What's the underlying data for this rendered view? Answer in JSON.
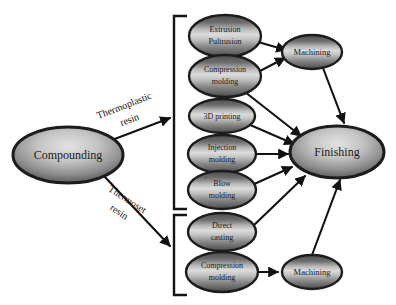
{
  "diagram": {
    "type": "flowchart",
    "background_color": "#ffffff",
    "node_border_color": "#1c1c1c",
    "node_fill_dark": "#585858",
    "node_fill_light": "#d8d8d8",
    "edge_color": "#111111",
    "nodes": [
      {
        "id": "compounding",
        "label_lines": [
          "Compounding"
        ],
        "cx": 68,
        "cy": 155,
        "rx": 55,
        "ry": 28,
        "font_size": 12
      },
      {
        "id": "extrusion-pultrusion",
        "label_lines": [
          "Extrusion",
          "Pultrusion"
        ],
        "cx": 225,
        "cy": 36,
        "rx": 36,
        "ry": 21,
        "font_size": 8
      },
      {
        "id": "compression-molding-thermoplastic",
        "label_lines": [
          "Compression",
          "molding"
        ],
        "cx": 225,
        "cy": 76,
        "rx": 36,
        "ry": 21,
        "font_size": 8
      },
      {
        "id": "3d-printing",
        "label_lines": [
          "3D printing"
        ],
        "cx": 222,
        "cy": 116,
        "rx": 33,
        "ry": 17,
        "font_size": 8
      },
      {
        "id": "injection-molding",
        "label_lines": [
          "Injection",
          "molding"
        ],
        "cx": 222,
        "cy": 154,
        "rx": 34,
        "ry": 19,
        "font_size": 8
      },
      {
        "id": "blow-molding",
        "label_lines": [
          "Blow",
          "molding"
        ],
        "cx": 222,
        "cy": 190,
        "rx": 34,
        "ry": 19,
        "font_size": 8
      },
      {
        "id": "direct-casting",
        "label_lines": [
          "Direct",
          "casting"
        ],
        "cx": 222,
        "cy": 232,
        "rx": 34,
        "ry": 19,
        "font_size": 8
      },
      {
        "id": "compression-molding-thermoset",
        "label_lines": [
          "Compression",
          "molding"
        ],
        "cx": 222,
        "cy": 272,
        "rx": 36,
        "ry": 20,
        "font_size": 8
      },
      {
        "id": "machining-top",
        "label_lines": [
          "Machining"
        ],
        "cx": 312,
        "cy": 52,
        "rx": 30,
        "ry": 17,
        "font_size": 8.5
      },
      {
        "id": "machining-bottom",
        "label_lines": [
          "Machining"
        ],
        "cx": 312,
        "cy": 272,
        "rx": 30,
        "ry": 17,
        "font_size": 8.5
      },
      {
        "id": "finishing",
        "label_lines": [
          "Finishing"
        ],
        "cx": 337,
        "cy": 152,
        "rx": 47,
        "ry": 26,
        "font_size": 12
      }
    ],
    "edges": [
      {
        "id": "compounding-to-thermoplastic-group",
        "from": "compounding",
        "to": "thermoplastic-bracket"
      },
      {
        "id": "compounding-to-thermoset-group",
        "from": "compounding",
        "to": "thermoset-bracket"
      },
      {
        "id": "extrusion-to-machining-top",
        "from": "extrusion-pultrusion",
        "to": "machining-top"
      },
      {
        "id": "compression-thermoplastic-to-machining-top",
        "from": "compression-molding-thermoplastic",
        "to": "machining-top"
      },
      {
        "id": "machining-top-to-finishing",
        "from": "machining-top",
        "to": "finishing"
      },
      {
        "id": "compression-thermoplastic-to-finishing",
        "from": "compression-molding-thermoplastic",
        "to": "finishing"
      },
      {
        "id": "3d-printing-to-finishing",
        "from": "3d-printing",
        "to": "finishing"
      },
      {
        "id": "injection-molding-to-finishing",
        "from": "injection-molding",
        "to": "finishing"
      },
      {
        "id": "blow-molding-to-finishing",
        "from": "blow-molding",
        "to": "finishing"
      },
      {
        "id": "direct-casting-to-finishing",
        "from": "direct-casting",
        "to": "finishing"
      },
      {
        "id": "compression-thermoset-to-machining-bottom",
        "from": "compression-molding-thermoset",
        "to": "machining-bottom"
      },
      {
        "id": "machining-bottom-to-finishing",
        "from": "machining-bottom",
        "to": "finishing"
      }
    ],
    "edge_labels": [
      {
        "id": "thermoplastic-resin",
        "line1": "Thermoplastic",
        "line2": "resin",
        "x": 127,
        "y": 113,
        "rotation": -21,
        "font_size": 10
      },
      {
        "id": "thermoset-resin",
        "line1": "Thermoset",
        "line2": "resin",
        "x": 123,
        "y": 206,
        "rotation": 33,
        "font_size": 10
      }
    ],
    "brackets": [
      {
        "id": "thermoplastic-bracket",
        "x": 174,
        "y_top": 16,
        "y_bottom": 209,
        "tab_width": 13
      },
      {
        "id": "thermoset-bracket",
        "x": 174,
        "y_top": 215,
        "y_bottom": 295,
        "tab_width": 13
      }
    ]
  }
}
